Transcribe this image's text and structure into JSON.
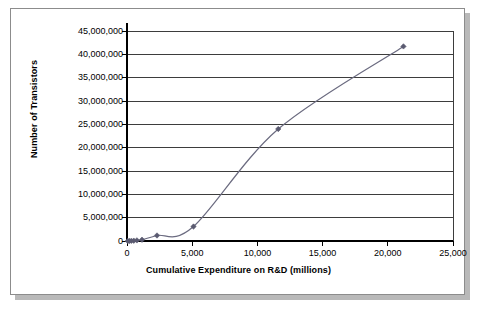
{
  "chart_data": {
    "type": "line",
    "title": "",
    "subtitle": "",
    "xlabel": "Cumulative Expenditure on R&D (millions)",
    "ylabel": "Number of Transistors",
    "xlim": [
      0,
      25000
    ],
    "ylim": [
      0,
      45000000
    ],
    "xticks": [
      0,
      5000,
      10000,
      15000,
      20000,
      25000
    ],
    "yticks": [
      0,
      5000000,
      10000000,
      15000000,
      20000000,
      25000000,
      30000000,
      35000000,
      40000000,
      45000000
    ],
    "xtick_labels": [
      "0",
      "5,000",
      "10,000",
      "15,000",
      "20,000",
      "25,000"
    ],
    "ytick_labels": [
      "0",
      "5,000,000",
      "10,000,000",
      "15,000,000",
      "20,000,000",
      "25,000,000",
      "30,000,000",
      "35,000,000",
      "40,000,000",
      "45,000,000"
    ],
    "grid": {
      "horizontal": true,
      "vertical": false
    },
    "legend": {
      "visible": false,
      "position": "none"
    },
    "series": [
      {
        "name": "Number of Transistors",
        "marker": "diamond",
        "color": "#6b6b80",
        "x": [
          60,
          180,
          330,
          520,
          760,
          1150,
          2300,
          5100,
          11600,
          21200
        ],
        "y": [
          2300,
          6000,
          29000,
          68000,
          134000,
          275000,
          1180000,
          3100000,
          24000000,
          41700000
        ]
      }
    ]
  },
  "axis_titles": {
    "y": "Number of Transistors",
    "x": "Cumulative Expenditure on R&D (millions)"
  },
  "colors": {
    "line": "#6b6b80",
    "marker": "#5a5a70",
    "gridline": "#3d3d3d",
    "axis": "#000000",
    "frame_border": "#8c8c8c",
    "shadow": "#b9b9b9",
    "background": "#ffffff"
  }
}
